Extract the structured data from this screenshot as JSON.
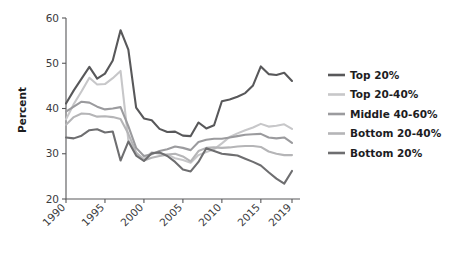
{
  "chart_data": {
    "type": "line",
    "title": "",
    "xlabel": "",
    "ylabel": "Percent",
    "xlim": [
      1990,
      2019
    ],
    "ylim": [
      20,
      60
    ],
    "yticks": [
      20,
      30,
      40,
      50,
      60
    ],
    "xticks": [
      1990,
      1995,
      2000,
      2005,
      2010,
      2015,
      2019
    ],
    "xtick_labels": [
      "1990",
      "1995",
      "2000",
      "2005",
      "2010",
      "2015",
      "2019"
    ],
    "ytick_labels": [
      "20",
      "30",
      "40",
      "50",
      "60"
    ],
    "grid": false,
    "legend_position": "right",
    "x": [
      1990,
      1991,
      1992,
      1993,
      1994,
      1995,
      1996,
      1997,
      1998,
      1999,
      2000,
      2001,
      2002,
      2003,
      2004,
      2005,
      2006,
      2007,
      2008,
      2009,
      2010,
      2011,
      2012,
      2013,
      2014,
      2015,
      2016,
      2017,
      2018,
      2019
    ],
    "series": [
      {
        "name": "Top 20%",
        "color": "#58585a",
        "values": [
          41.1,
          44.0,
          46.6,
          49.2,
          46.6,
          47.7,
          50.6,
          57.3,
          53.0,
          40.2,
          37.8,
          37.4,
          35.5,
          34.8,
          34.9,
          34.0,
          33.9,
          36.9,
          35.6,
          36.3,
          41.6,
          42.0,
          42.6,
          43.4,
          45.1,
          49.3,
          47.6,
          47.4,
          47.9,
          46.1
        ]
      },
      {
        "name": "Top 20-40%",
        "color": "#c7c7c9",
        "values": [
          37.6,
          41.0,
          43.8,
          46.8,
          45.3,
          45.4,
          46.7,
          48.3,
          33.0,
          30.1,
          28.9,
          30.3,
          30.0,
          29.8,
          29.0,
          28.6,
          28.0,
          29.7,
          30.4,
          31.0,
          32.3,
          33.7,
          34.5,
          35.2,
          35.8,
          36.6,
          36.0,
          36.2,
          36.5,
          35.5
        ]
      },
      {
        "name": "Middle 40-60%",
        "color": "#9b9b9e",
        "values": [
          39.3,
          40.4,
          41.5,
          41.3,
          40.4,
          39.8,
          40.0,
          40.3,
          36.1,
          31.3,
          29.5,
          29.9,
          30.6,
          31.0,
          31.6,
          31.3,
          30.8,
          32.6,
          33.1,
          33.3,
          33.3,
          33.6,
          33.9,
          34.2,
          34.3,
          34.4,
          33.6,
          33.4,
          33.6,
          32.4
        ]
      },
      {
        "name": "Bottom 20-40%",
        "color": "#b5b5b7",
        "values": [
          36.4,
          38.1,
          38.9,
          38.8,
          38.2,
          38.3,
          38.1,
          37.7,
          34.4,
          30.3,
          28.5,
          29.1,
          29.5,
          29.8,
          30.0,
          29.4,
          28.3,
          30.6,
          31.3,
          31.4,
          31.3,
          31.4,
          31.6,
          31.7,
          31.7,
          31.5,
          30.5,
          30.0,
          29.7,
          29.7
        ]
      },
      {
        "name": "Bottom 20%",
        "color": "#6e6e70",
        "values": [
          33.6,
          33.4,
          34.0,
          35.2,
          35.4,
          34.7,
          34.9,
          28.5,
          32.7,
          29.6,
          28.4,
          30.1,
          30.3,
          29.5,
          28.2,
          26.5,
          26.1,
          28.2,
          31.2,
          30.6,
          30.0,
          29.8,
          29.6,
          28.9,
          28.2,
          27.4,
          25.9,
          24.5,
          23.4,
          26.2
        ]
      }
    ]
  },
  "legend": {
    "items": [
      {
        "label": "Top 20%"
      },
      {
        "label": "Top 20-40%"
      },
      {
        "label": "Middle 40-60%"
      },
      {
        "label": "Bottom 20-40%"
      },
      {
        "label": "Bottom 20%"
      }
    ]
  },
  "axis": {
    "y_title": "Percent"
  }
}
